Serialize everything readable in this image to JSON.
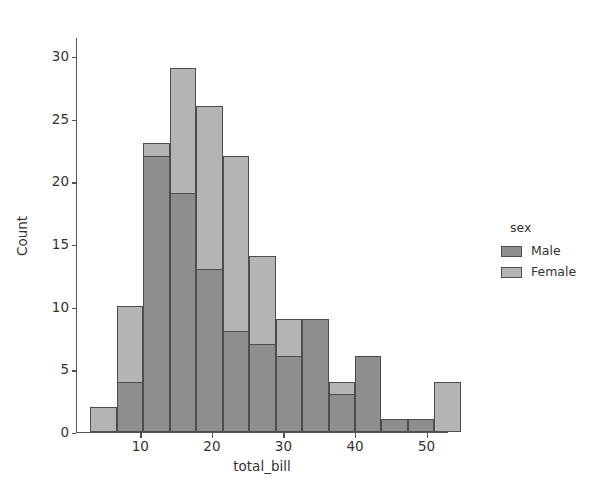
{
  "chart_data": {
    "type": "bar",
    "subtype": "histogram-overlapping",
    "title": "",
    "xlabel": "total_bill",
    "ylabel": "Count",
    "xlim": [
      1.0,
      53.0
    ],
    "ylim": [
      0,
      31.5
    ],
    "xticks": [
      10,
      20,
      30,
      40,
      50
    ],
    "yticks": [
      0,
      5,
      10,
      15,
      20,
      25,
      30
    ],
    "grid": false,
    "bin_edges": [
      3.0,
      6.7,
      10.4,
      14.1,
      17.8,
      21.5,
      25.2,
      28.9,
      32.6,
      36.3,
      40.0,
      43.7,
      47.4,
      51.1
    ],
    "bin_centers": [
      4.85,
      8.55,
      12.25,
      15.95,
      19.65,
      23.35,
      27.05,
      30.75,
      34.45,
      38.15,
      41.85,
      45.55,
      49.25
    ],
    "series": [
      {
        "name": "Female",
        "color": "#b4b4b4",
        "values": [
          2,
          10,
          23,
          29,
          26,
          22,
          14,
          9,
          9,
          4,
          6,
          1,
          1,
          4
        ]
      },
      {
        "name": "Male",
        "color": "#8e8e8e",
        "values": [
          0,
          4,
          22,
          19,
          13,
          8,
          7,
          6,
          9,
          3,
          6,
          1,
          1,
          0
        ]
      }
    ],
    "legend": {
      "title": "sex",
      "position": "right",
      "entries": [
        {
          "label": "Male",
          "color": "#8e8e8e"
        },
        {
          "label": "Female",
          "color": "#b4b4b4"
        }
      ]
    },
    "edge_color": "#4d4d4d",
    "background": "#ffffff"
  },
  "axis": {
    "x_tick_labels": [
      "10",
      "20",
      "30",
      "40",
      "50"
    ],
    "y_tick_labels": [
      "0",
      "5",
      "10",
      "15",
      "20",
      "25",
      "30"
    ],
    "x_title": "total_bill",
    "y_title": "Count"
  },
  "legend": {
    "title": "sex",
    "items": [
      {
        "label": "Male"
      },
      {
        "label": "Female"
      }
    ]
  }
}
